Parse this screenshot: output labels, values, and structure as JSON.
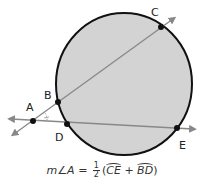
{
  "diagram": {
    "circle": {
      "cx": 124,
      "cy": 84,
      "rx": 68,
      "ry": 71,
      "fill": "#d3d3d3",
      "stroke": "#111111"
    },
    "points": {
      "A": {
        "label": "A",
        "x": 33,
        "y": 121,
        "lx": 26,
        "ly": 111
      },
      "B": {
        "label": "B",
        "x": 58,
        "y": 102,
        "lx": 44,
        "ly": 99
      },
      "C": {
        "label": "C",
        "x": 161,
        "y": 27,
        "lx": 151,
        "ly": 16
      },
      "D": {
        "label": "D",
        "x": 67,
        "y": 124,
        "lx": 55,
        "ly": 141
      },
      "E": {
        "label": "E",
        "x": 177,
        "y": 128,
        "lx": 179,
        "ly": 149
      }
    },
    "line_color": "#888888",
    "formula": {
      "lhs": "m∠A = ",
      "frac_num": "1",
      "frac_den": "2",
      "open": "(",
      "arc1": "CE",
      "op": " + ",
      "arc2": "BD",
      "close": ")"
    }
  }
}
